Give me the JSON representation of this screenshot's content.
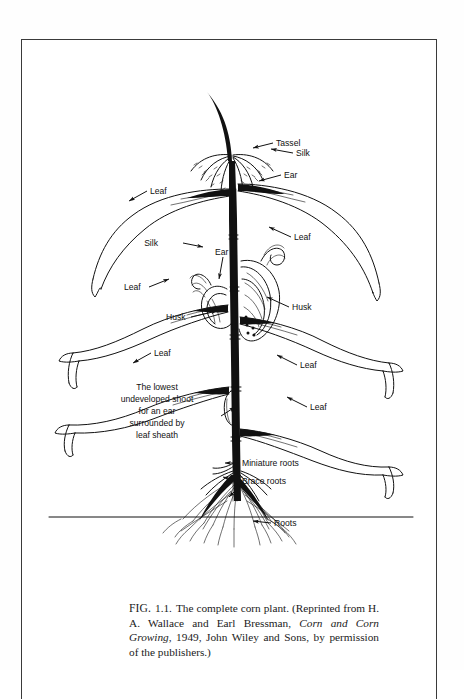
{
  "page": {
    "kind": "book-figure-page",
    "background_color": "#ffffff",
    "border_color": "#3a3a3a"
  },
  "figure": {
    "title": "The complete corn plant",
    "ink_color": "#111111",
    "label_font_color": "#111111",
    "ground_line_label": "soil surface"
  },
  "labels": [
    {
      "id": "tassel",
      "text": "Tassel"
    },
    {
      "id": "leaf-upper-left",
      "text": "Leaf"
    },
    {
      "id": "silk-right",
      "text": "Silk"
    },
    {
      "id": "ear-right",
      "text": "Ear"
    },
    {
      "id": "leaf-upper-right",
      "text": "Leaf"
    },
    {
      "id": "silk-left",
      "text": "Silk"
    },
    {
      "id": "ear-left",
      "text": "Ear"
    },
    {
      "id": "leaf-mid-left",
      "text": "Leaf"
    },
    {
      "id": "husk-right",
      "text": "Husk"
    },
    {
      "id": "husk-left",
      "text": "Husk"
    },
    {
      "id": "leaf-mid-right",
      "text": "Leaf"
    },
    {
      "id": "leaf-lower-left",
      "text": "Leaf"
    },
    {
      "id": "leaf-lower-right",
      "text": "Leaf"
    },
    {
      "id": "miniature-roots",
      "text": "Miniature roots"
    },
    {
      "id": "brace-roots",
      "text": "Brace roots"
    },
    {
      "id": "roots",
      "text": "Roots"
    }
  ],
  "shoot_note": {
    "lines": [
      "The lowest",
      "undeveloped shoot",
      "for an ear",
      "surrounded by",
      "leaf sheath"
    ]
  },
  "caption": {
    "figure_number": "FIG. 1.1.",
    "fig_prefix": "FIG.",
    "fig_index": "1.1.",
    "sentence": "The complete corn plant. (Reprinted from H. A.",
    "line2_pre": "Wallace and Earl Bressman,",
    "book_title": "Corn and Corn Growing",
    "line2_post": ", 1949,",
    "line3": "John Wiley and Sons, by permission of the publishers.)"
  }
}
